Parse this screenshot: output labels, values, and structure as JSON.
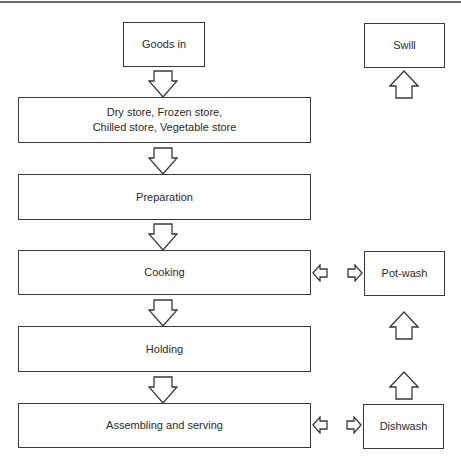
{
  "diagram": {
    "type": "flowchart",
    "title": "",
    "main_flow": [
      {
        "id": "goods_in",
        "label": "Goods in"
      },
      {
        "id": "stores",
        "label_line1": "Dry store, Frozen store,",
        "label_line2": "Chilled store, Vegetable store"
      },
      {
        "id": "preparation",
        "label": "Preparation"
      },
      {
        "id": "cooking",
        "label": "Cooking"
      },
      {
        "id": "holding",
        "label": "Holding"
      },
      {
        "id": "assembling",
        "label": "Assembling and serving"
      }
    ],
    "side_flow": [
      {
        "id": "swill",
        "label": "Swill"
      },
      {
        "id": "pot_wash",
        "label": "Pot-wash"
      },
      {
        "id": "dishwash",
        "label": "Dishwash"
      }
    ],
    "connections": [
      {
        "from": "goods_in",
        "to": "stores",
        "direction": "down"
      },
      {
        "from": "stores",
        "to": "preparation",
        "direction": "down"
      },
      {
        "from": "preparation",
        "to": "cooking",
        "direction": "down"
      },
      {
        "from": "cooking",
        "to": "holding",
        "direction": "down"
      },
      {
        "from": "holding",
        "to": "assembling",
        "direction": "down"
      },
      {
        "from": "cooking",
        "to": "pot_wash",
        "direction": "bidirectional"
      },
      {
        "from": "assembling",
        "to": "dishwash",
        "direction": "bidirectional"
      },
      {
        "from": "dishwash",
        "to": "pot_wash",
        "direction": "up"
      },
      {
        "from": "pot_wash",
        "to": "swill",
        "direction": "up"
      }
    ],
    "colors": {
      "stroke": "#3a3a3a",
      "fill": "#ffffff",
      "text": "#2a2a2a"
    }
  }
}
